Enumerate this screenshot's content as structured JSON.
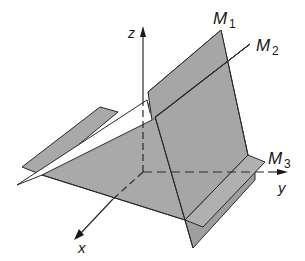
{
  "diagram": {
    "title": "",
    "axes": {
      "x": {
        "label": "x"
      },
      "y": {
        "label": "y"
      },
      "z": {
        "label": "z"
      }
    },
    "planes": [
      {
        "id": "M1",
        "label": "M",
        "subscript": "1"
      },
      {
        "id": "M2",
        "label": "M",
        "subscript": "2"
      },
      {
        "id": "M3",
        "label": "M",
        "subscript": "3"
      }
    ],
    "colors": {
      "plane_fill": "#a9a9a9",
      "plane_fill_dark": "#9a9a9a",
      "plane_fill_white": "#ffffff",
      "edge": "#2a2a2a",
      "background": "#ffffff"
    }
  }
}
